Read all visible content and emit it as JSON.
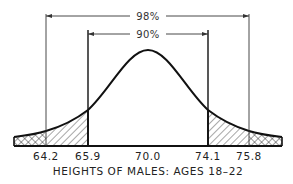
{
  "diagram": {
    "title": "HEIGHTS OF MALES: AGES 18–22",
    "type": "normal-distribution",
    "ranges": [
      {
        "label": "98%",
        "from": "64.2",
        "to": "75.8"
      },
      {
        "label": "90%",
        "from": "65.9",
        "to": "74.1"
      }
    ],
    "ticks": [
      "64.2",
      "65.9",
      "70.0",
      "74.1",
      "75.8"
    ],
    "regions": [
      {
        "name": "left-tail-1pct",
        "fill": "crosshatch"
      },
      {
        "name": "left-4pct",
        "fill": "diagonal-hatch"
      },
      {
        "name": "center-90pct",
        "fill": "none"
      },
      {
        "name": "right-4pct",
        "fill": "diagonal-hatch"
      },
      {
        "name": "right-tail-1pct",
        "fill": "crosshatch"
      }
    ],
    "colors": {
      "line": "#111111",
      "background": "#ffffff"
    }
  }
}
